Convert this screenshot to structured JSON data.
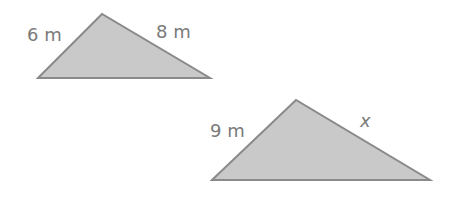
{
  "figure": {
    "colors": {
      "fill": "#c9c9c9",
      "stroke": "#8a8a8a",
      "text": "#7a7a7a",
      "background": "#ffffff"
    },
    "triangles": [
      {
        "id": "small-triangle",
        "points": "38,78 102,14 210,78",
        "labels": [
          {
            "side": "left",
            "text": "6 m",
            "x": 27,
            "y": 41
          },
          {
            "side": "right",
            "text": "8 m",
            "x": 156,
            "y": 38
          }
        ]
      },
      {
        "id": "large-triangle",
        "points": "212,180 296,100 430,180",
        "labels": [
          {
            "side": "left",
            "text": "9 m",
            "x": 210,
            "y": 137
          },
          {
            "side": "right",
            "text": "x",
            "x": 360,
            "y": 127,
            "italic": true
          }
        ]
      }
    ]
  }
}
